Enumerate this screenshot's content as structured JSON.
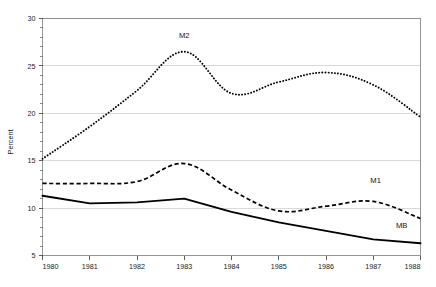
{
  "chart_data": {
    "type": "line",
    "title": "",
    "subtitle": "",
    "xlabel": "",
    "ylabel": "Percent",
    "xlim": [
      1980,
      1988
    ],
    "ylim": [
      5,
      30
    ],
    "grid": true,
    "legend_position": "inline-annotations",
    "x_tick_labels": [
      "1980",
      "1981",
      "1982",
      "1983",
      "1984",
      "1985",
      "1986",
      "1987",
      "1988"
    ],
    "y_tick_labels": [
      "5",
      "10",
      "15",
      "20",
      "25",
      "30"
    ],
    "y_ticks": [
      5,
      10,
      15,
      20,
      25,
      30
    ],
    "y_minor_ticks": [
      6,
      7,
      8,
      9,
      11,
      12,
      13,
      14,
      16,
      17,
      18,
      19,
      21,
      22,
      23,
      24,
      26,
      27,
      28,
      29
    ],
    "x": [
      1980,
      1981,
      1982,
      1983,
      1984,
      1985,
      1986,
      1987,
      1988
    ],
    "series": [
      {
        "name": "M2",
        "style": "dotted",
        "color": "#000000",
        "label_x": 1983.0,
        "label_y": 27.9,
        "values": [
          15.2,
          18.6,
          22.4,
          26.5,
          22.1,
          23.3,
          24.3,
          23.0,
          19.6
        ]
      },
      {
        "name": "M1",
        "style": "dashed",
        "color": "#000000",
        "label_x": 1987.05,
        "label_y": 12.6,
        "values": [
          12.6,
          12.6,
          12.8,
          14.7,
          11.9,
          9.7,
          10.2,
          10.7,
          8.9
        ]
      },
      {
        "name": "MB",
        "style": "solid",
        "color": "#000000",
        "label_x": 1987.6,
        "label_y": 7.9,
        "values": [
          11.3,
          10.5,
          10.6,
          11.0,
          9.6,
          8.5,
          7.6,
          6.7,
          6.3
        ]
      }
    ]
  },
  "axis": {
    "y_title": "Percent"
  },
  "labels": {
    "m2": "M2",
    "m1": "M1",
    "mb": "MB"
  }
}
